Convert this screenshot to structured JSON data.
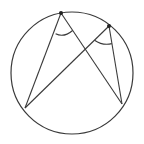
{
  "diagram": {
    "type": "inscribed-angles",
    "stroke_color": "#3a3a3a",
    "background": "#ffffff",
    "circle": {
      "cx": 72,
      "cy": 73,
      "r": 61
    },
    "points": [
      {
        "id": "top-left-vertex",
        "x": 61,
        "y": 13,
        "marked": true
      },
      {
        "id": "top-right-vertex",
        "x": 109,
        "y": 26,
        "marked": true
      },
      {
        "id": "bottom-left-point",
        "x": 25,
        "y": 108,
        "marked": false
      },
      {
        "id": "bottom-right-point",
        "x": 122,
        "y": 104,
        "marked": false
      }
    ],
    "segments": [
      {
        "from": "top-left-vertex",
        "to": "bottom-left-point"
      },
      {
        "from": "top-left-vertex",
        "to": "bottom-right-point"
      },
      {
        "from": "top-right-vertex",
        "to": "bottom-left-point"
      },
      {
        "from": "top-right-vertex",
        "to": "bottom-right-point"
      }
    ],
    "angle_marks": [
      {
        "vertex": "top-left-vertex",
        "description": "inscribed angle arc"
      },
      {
        "vertex": "top-right-vertex",
        "description": "inscribed angle arc"
      }
    ]
  }
}
